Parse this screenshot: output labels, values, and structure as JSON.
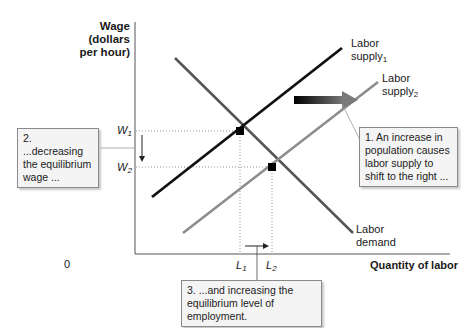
{
  "diagram": {
    "type": "labor-market supply shift",
    "y_axis_label": [
      "Wage",
      "(dollars",
      "per hour)"
    ],
    "x_axis_label": "Quantity of labor",
    "origin_label": "0",
    "curves": {
      "demand": {
        "label_line1": "Labor",
        "label_line2": "demand",
        "color": "#555555"
      },
      "supply1": {
        "label_line1": "Labor",
        "label_line2_main": "supply",
        "label_line2_sub": "1",
        "color": "#111111"
      },
      "supply2": {
        "label_line1": "Labor",
        "label_line2_main": "supply",
        "label_line2_sub": "2",
        "color": "#8c8c8c"
      }
    },
    "ticks": {
      "w1": {
        "main": "W",
        "sub": "1"
      },
      "w2": {
        "main": "W",
        "sub": "2"
      },
      "l1": {
        "main": "L",
        "sub": "1"
      },
      "l2": {
        "main": "L",
        "sub": "2"
      }
    },
    "callouts": {
      "c1": [
        "1. An increase in",
        "population causes",
        "labor supply to",
        "shift to the right ..."
      ],
      "c2": [
        "2. ...decreasing",
        "the equilibrium",
        "wage ..."
      ],
      "c3": [
        "3.  ...and increasing the",
        "equilibrium level of employment."
      ]
    }
  }
}
